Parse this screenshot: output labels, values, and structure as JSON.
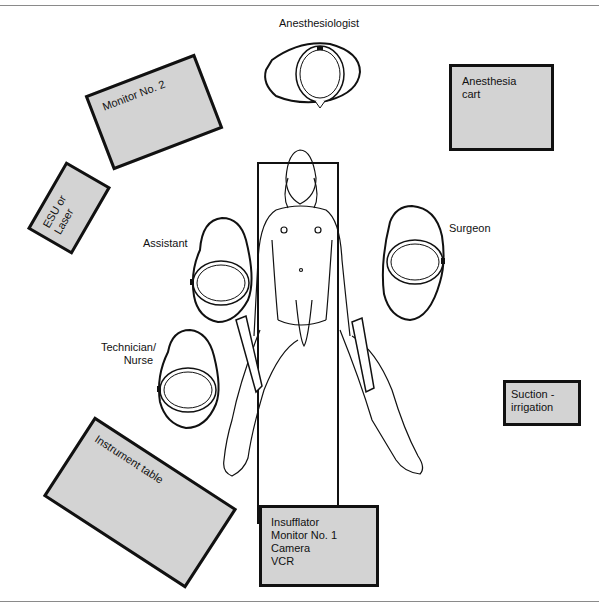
{
  "diagram": {
    "type": "operating-room-layout",
    "personnel": {
      "anesthesiologist": "Anesthesiologist",
      "assistant": "Assistant",
      "surgeon": "Surgeon",
      "technician": [
        "Technician/",
        "Nurse"
      ]
    },
    "equipment": {
      "monitor2": "Monitor No. 2",
      "anesthesia_cart": [
        "Anesthesia",
        "cart"
      ],
      "esu": [
        "ESU or",
        "Laser"
      ],
      "suction": [
        "Suction -",
        "irrigation"
      ],
      "instrument_table": "Instrument table",
      "tower": [
        "Insufflator",
        "Monitor No. 1",
        "Camera",
        "VCR"
      ]
    },
    "colors": {
      "equipment_fill": "#d3d3d3",
      "outline": "#111111"
    }
  }
}
